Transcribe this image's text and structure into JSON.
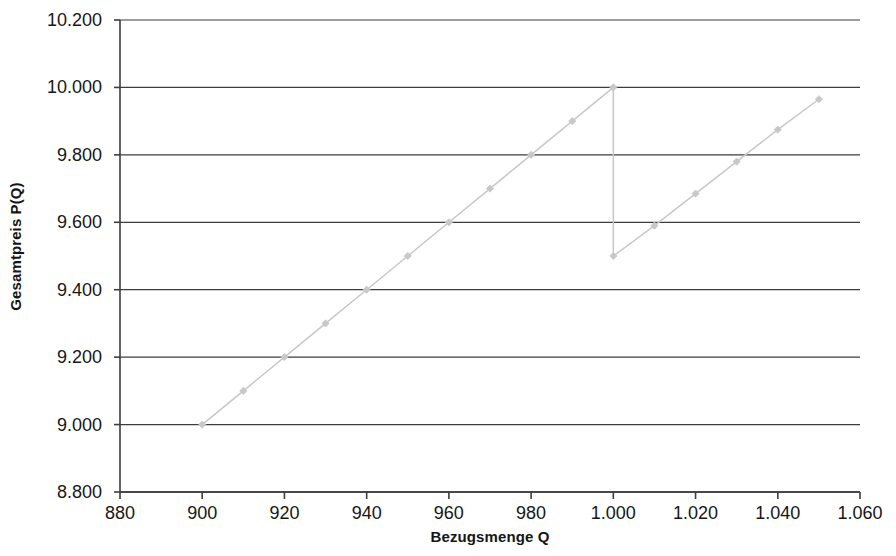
{
  "chart_data": {
    "type": "line",
    "title": "",
    "xlabel": "Bezugsmenge Q",
    "ylabel": "Gesamtpreis P(Q)",
    "xlim": [
      880,
      1060
    ],
    "ylim": [
      8.8,
      10.2
    ],
    "grid": true,
    "grid_axis": "y",
    "legend": false,
    "series_color": "#c8c8c8",
    "marker": "diamond",
    "x_tick_labels": [
      "880",
      "900",
      "920",
      "940",
      "960",
      "980",
      "1.000",
      "1.020",
      "1.040",
      "1.060"
    ],
    "x_ticks": [
      880,
      900,
      920,
      940,
      960,
      980,
      1000,
      1020,
      1040,
      1060
    ],
    "y_tick_labels": [
      "8.800",
      "9.000",
      "9.200",
      "9.400",
      "9.600",
      "9.800",
      "10.000",
      "10.200"
    ],
    "y_ticks": [
      8.8,
      9.0,
      9.2,
      9.4,
      9.6,
      9.8,
      10.0,
      10.2
    ],
    "series": [
      {
        "name": "Gesamtpreis P(Q)",
        "x": [
          900,
          910,
          920,
          930,
          940,
          950,
          960,
          970,
          980,
          990,
          1000,
          1000,
          1010,
          1020,
          1030,
          1040,
          1050
        ],
        "values": [
          9.0,
          9.1,
          9.2,
          9.3,
          9.4,
          9.5,
          9.6,
          9.7,
          9.8,
          9.9,
          10.0,
          9.5,
          9.59,
          9.685,
          9.78,
          9.875,
          9.965
        ]
      }
    ]
  },
  "axes": {
    "y_title": "Gesamtpreis P(Q)",
    "x_title": "Bezugsmenge Q"
  }
}
